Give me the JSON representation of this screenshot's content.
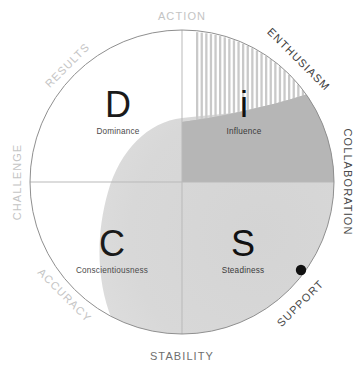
{
  "diagram": {
    "geometry": {
      "width": 360,
      "height": 372,
      "center_x": 182,
      "center_y": 182,
      "radius": 152
    },
    "colors": {
      "outline": "#8a8a8a",
      "axis": "#b9b9b9",
      "blob_light": "#d6d6d6",
      "blob_dark": "#b4b4b4",
      "hatch": "#c9c9c9",
      "text_dark": "#3f3f3f",
      "text_mid": "#6e6e6e",
      "text_light": "#c4c4c4",
      "letter": "#1a1a1a",
      "marker": "#111111"
    }
  },
  "axis_labels": [
    {
      "id": "action",
      "text": "ACTION",
      "tone": "light",
      "angle": 0,
      "size": 11
    },
    {
      "id": "results",
      "text": "RESULTS",
      "tone": "light",
      "angle": -45,
      "size": 11
    },
    {
      "id": "challenge",
      "text": "CHALLENGE",
      "tone": "light",
      "angle": -90,
      "size": 11
    },
    {
      "id": "accuracy",
      "text": "ACCURACY",
      "tone": "light",
      "angle": 45,
      "size": 11
    },
    {
      "id": "stability",
      "text": "STABILITY",
      "tone": "mid",
      "angle": 0,
      "size": 11
    },
    {
      "id": "support",
      "text": "SUPPORT",
      "tone": "dark",
      "angle": -45,
      "size": 11
    },
    {
      "id": "collaboration",
      "text": "COLLABORATION",
      "tone": "dark",
      "angle": 90,
      "size": 11
    },
    {
      "id": "enthusiasm",
      "text": "ENTHUSIASM",
      "tone": "dark",
      "angle": 45,
      "size": 11
    }
  ],
  "quadrants": [
    {
      "id": "d",
      "letter": "D",
      "name": "Dominance",
      "position": "top-left"
    },
    {
      "id": "i",
      "letter": "i",
      "name": "Influence",
      "position": "top-right"
    },
    {
      "id": "c",
      "letter": "C",
      "name": "Conscientiousness",
      "position": "bottom-left"
    },
    {
      "id": "s",
      "letter": "S",
      "name": "Steadiness",
      "position": "bottom-right"
    }
  ],
  "marker": {
    "id": "respondent-dot",
    "label": "",
    "x": 301,
    "y": 270,
    "r": 5.2
  },
  "chart_data": {
    "type": "scatter",
    "xlabel": "",
    "ylabel": "",
    "axis_poles": {
      "north": "ACTION",
      "northeast": "ENTHUSIASM",
      "east": "COLLABORATION",
      "southeast": "SUPPORT",
      "south": "STABILITY",
      "southwest": "ACCURACY",
      "west": "CHALLENGE",
      "northwest": "RESULTS"
    },
    "quadrant_labels": [
      "D",
      "i",
      "C",
      "S"
    ],
    "points": [
      {
        "name": "respondent",
        "x": 301,
        "y": 270
      }
    ]
  }
}
